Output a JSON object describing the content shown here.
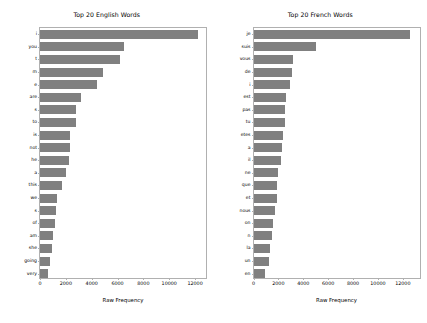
{
  "figure": {
    "width": 427,
    "height": 323,
    "background": "#ffffff",
    "bar_color": "#808080",
    "axis_color": "#b0b0b0"
  },
  "chart_data": [
    {
      "type": "bar",
      "orientation": "horizontal",
      "title": "Top 20 English Words",
      "xlabel": "Raw Frequency",
      "ylabel": "",
      "grid": false,
      "legend": null,
      "xlim": [
        0,
        13000
      ],
      "xticks": [
        0,
        2000,
        4000,
        6000,
        8000,
        10000,
        12000
      ],
      "xticklabels": [
        "0",
        "2000",
        "4000",
        "6000",
        "8000",
        "10000",
        "12000"
      ],
      "categories": [
        "i",
        "you",
        "t",
        "m",
        "e",
        "are",
        "s",
        "to",
        "is",
        "not",
        "he",
        "a",
        "this",
        "we",
        "s",
        "of",
        "am",
        "she",
        "going",
        "very"
      ],
      "values": [
        12200,
        6500,
        6200,
        4900,
        4400,
        3200,
        2800,
        2750,
        2350,
        2300,
        2250,
        2000,
        1700,
        1350,
        1200,
        1150,
        1000,
        900,
        800,
        650
      ]
    },
    {
      "type": "bar",
      "orientation": "horizontal",
      "title": "Top 20 French Words",
      "xlabel": "Raw Frequency",
      "ylabel": "",
      "grid": false,
      "legend": null,
      "xlim": [
        0,
        13500
      ],
      "xticks": [
        0,
        2000,
        4000,
        6000,
        8000,
        10000,
        12000
      ],
      "xticklabels": [
        "0",
        "2000",
        "4000",
        "6000",
        "8000",
        "10000",
        "12000"
      ],
      "categories": [
        "je",
        "suis",
        "vous",
        "de",
        "i",
        "est",
        "pas",
        "tu",
        "etes",
        "a",
        "il",
        "ne",
        "que",
        "et",
        "nous",
        "on",
        "n",
        "la",
        "un",
        "en"
      ],
      "values": [
        12600,
        5000,
        3150,
        3100,
        2950,
        2600,
        2550,
        2500,
        2400,
        2300,
        2200,
        1950,
        1900,
        1850,
        1750,
        1600,
        1500,
        1300,
        1250,
        900
      ]
    }
  ]
}
